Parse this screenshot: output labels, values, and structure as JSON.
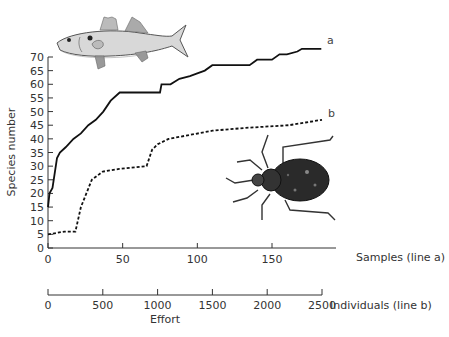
{
  "chart_data": {
    "type": "line",
    "title": "",
    "ylabel": "Species number",
    "xlabel": "Effort",
    "ylim": [
      0,
      70
    ],
    "yticks": [
      0,
      5,
      10,
      15,
      20,
      25,
      30,
      35,
      40,
      45,
      50,
      55,
      60,
      65,
      70
    ],
    "grid": false,
    "x_axes": [
      {
        "label": "Samples (line a)",
        "range": [
          0,
          183
        ],
        "ticks": [
          0,
          50,
          100,
          150
        ]
      },
      {
        "label": "Individuals (line b)",
        "range": [
          0,
          2500
        ],
        "ticks": [
          0,
          500,
          1000,
          1500,
          2000,
          2500
        ]
      }
    ],
    "series": [
      {
        "name": "a",
        "style": "solid",
        "x_axis": "Samples (line a)",
        "x": [
          0,
          1,
          3,
          6,
          8,
          12,
          17,
          22,
          27,
          32,
          37,
          42,
          48,
          60,
          75,
          76,
          82,
          88,
          95,
          100,
          105,
          110,
          120,
          135,
          140,
          150,
          155,
          160,
          167,
          170,
          175,
          183
        ],
        "values": [
          15,
          20,
          22,
          33,
          35,
          37,
          40,
          42,
          45,
          47,
          50,
          54,
          57,
          57,
          57,
          60,
          60,
          62,
          63,
          64,
          65,
          67,
          67,
          67,
          69,
          69,
          71,
          71,
          72,
          73,
          73,
          73
        ]
      },
      {
        "name": "b",
        "style": "dashed",
        "x_axis": "Individuals (line b)",
        "x": [
          0,
          150,
          250,
          300,
          400,
          500,
          650,
          900,
          950,
          1000,
          1100,
          1500,
          1800,
          2200,
          2350,
          2500
        ],
        "values": [
          5,
          6,
          6,
          15,
          25,
          28,
          29,
          30,
          36,
          38,
          40,
          43,
          44,
          45,
          46,
          47
        ]
      }
    ],
    "annotations": [
      "fish illustration (top-left)",
      "beetle illustration (right-center)"
    ]
  },
  "labels": {
    "ylabel": "Species number",
    "xlabel_top": "Samples (line a)",
    "xlabel_bottom": "Individuals (line b)",
    "effort": "Effort",
    "series_a": "a",
    "series_b": "b"
  },
  "ticks": {
    "y": [
      "0",
      "5",
      "10",
      "15",
      "20",
      "25",
      "30",
      "35",
      "40",
      "45",
      "50",
      "55",
      "60",
      "65",
      "70"
    ],
    "samples": [
      "0",
      "50",
      "100",
      "150"
    ],
    "individuals": [
      "0",
      "500",
      "1000",
      "1500",
      "2000",
      "2500"
    ]
  }
}
